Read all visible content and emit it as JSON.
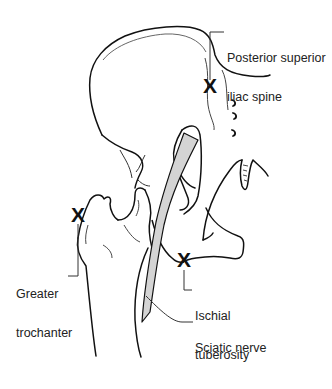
{
  "diagram": {
    "marker_glyph": "X",
    "colors": {
      "outline": "#111111",
      "sciatic_nerve_fill": "#d4d4d4",
      "leader_line": "#333333",
      "background": "#ffffff"
    },
    "labels": {
      "psis": {
        "line1": "Posterior superior",
        "line2": "iliac spine"
      },
      "greater_trochanter": {
        "line1": "Greater",
        "line2": "trochanter"
      },
      "ischial_tuberosity": {
        "line1": "Ischial",
        "line2": "tuberosity"
      },
      "sciatic_nerve": {
        "line1": "Sciatic nerve"
      }
    }
  }
}
